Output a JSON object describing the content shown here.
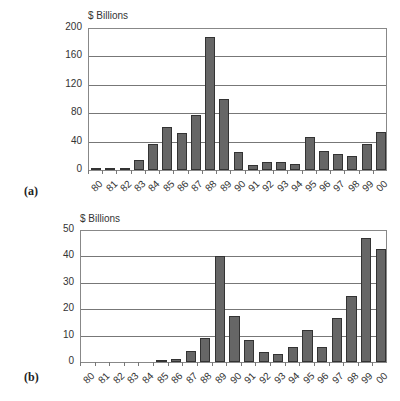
{
  "chart_data": [
    {
      "type": "bar",
      "panel": "(a)",
      "title": "",
      "ylabel": "$ Billions",
      "xlabel": "",
      "categories": [
        "80",
        "81",
        "82",
        "83",
        "84",
        "85",
        "86",
        "87",
        "88",
        "89",
        "90",
        "91",
        "92",
        "93",
        "94",
        "95",
        "96",
        "97",
        "98",
        "99",
        "00"
      ],
      "values": [
        2,
        2,
        3,
        14,
        37,
        61,
        52,
        78,
        188,
        100,
        25,
        7,
        11,
        11,
        8,
        46,
        27,
        23,
        20,
        36,
        54
      ],
      "yticks": [
        "0",
        "40",
        "80",
        "120",
        "160",
        "200"
      ],
      "ylim": [
        0,
        200
      ],
      "grid": true,
      "legend": "none"
    },
    {
      "type": "bar",
      "panel": "(b)",
      "title": "",
      "ylabel": "$ Billions",
      "xlabel": "",
      "categories": [
        "80",
        "81",
        "82",
        "83",
        "84",
        "85",
        "86",
        "87",
        "88",
        "89",
        "90",
        "91",
        "92",
        "93",
        "94",
        "95",
        "96",
        "97",
        "98",
        "99",
        "00"
      ],
      "values": [
        0,
        0,
        0,
        0,
        0,
        0.8,
        1,
        4.3,
        9,
        40,
        17.5,
        8.2,
        3.8,
        3,
        5.8,
        12,
        5.6,
        16.5,
        25,
        46.8,
        42.7
      ],
      "yticks": [
        "0",
        "10",
        "20",
        "30",
        "40",
        "50"
      ],
      "ylim": [
        0,
        50
      ],
      "grid": true,
      "legend": "none"
    }
  ],
  "colors": {
    "bar_fill": "#666666",
    "bar_border": "#333333",
    "grid": "#777777"
  }
}
